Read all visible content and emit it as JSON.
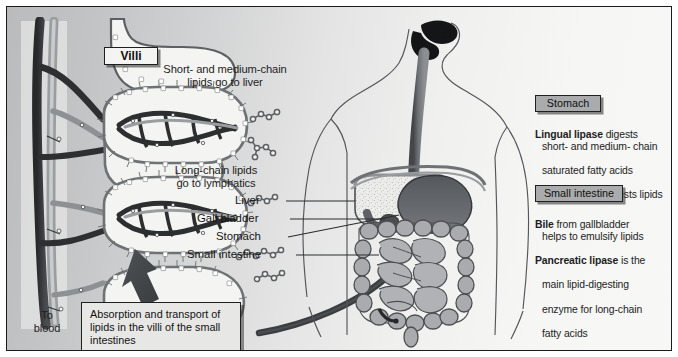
{
  "figure": {
    "background_left": "#c2c4c6",
    "background_right": "#f7f7f6",
    "frame_color": "#1b1b1b"
  },
  "villi_panel": {
    "tag": "Villi",
    "note_short_chain": "Short- and medium-chain\nlipids go to liver",
    "note_long_chain": "Long-chain lipids\ngo to lymphatics",
    "to_blood": "To\nblood",
    "callout": "Absorption and transport\nof lipids in the villi of the\nsmall intestines"
  },
  "organ_labels": [
    {
      "name": "Liver"
    },
    {
      "name": "Gall bladder"
    },
    {
      "name": "Stomach"
    },
    {
      "name": "Small intestine"
    }
  ],
  "info_panels": [
    {
      "tag": "Stomach",
      "lines": [
        {
          "bold": "Lingual lipase",
          "rest": " digests",
          "indent": false
        },
        {
          "bold": "",
          "rest": "short- and medium- chain",
          "indent": true
        },
        {
          "bold": "",
          "rest": "saturated fatty acids",
          "indent": true
        },
        {
          "bold": "Gastric lipase",
          "rest": " digests lipids",
          "indent": false
        }
      ]
    },
    {
      "tag": "Small intestine",
      "lines": [
        {
          "bold": "Bile",
          "rest": " from gallbladder",
          "indent": false
        },
        {
          "bold": "",
          "rest": "helps to emulsify lipids",
          "indent": true
        },
        {
          "bold": "Pancreatic lipase",
          "rest": " is the",
          "indent": false
        },
        {
          "bold": "",
          "rest": "main lipid-digesting",
          "indent": true
        },
        {
          "bold": "",
          "rest": "enzyme for long-chain",
          "indent": true
        },
        {
          "bold": "",
          "rest": "fatty acids",
          "indent": true
        }
      ]
    }
  ],
  "colors": {
    "villus_wall": "#6f7274",
    "capillary_dark": "#2a2b2d",
    "lacteal": "#8e9193",
    "stomach_fill": "#63666a",
    "intestine_fill": "#a7a9ac",
    "liver_fill": "#e9e9e8",
    "esophagus": "#6d7073",
    "tag_gray": "#a9abac",
    "panel_bg": "#e7e7e6"
  }
}
